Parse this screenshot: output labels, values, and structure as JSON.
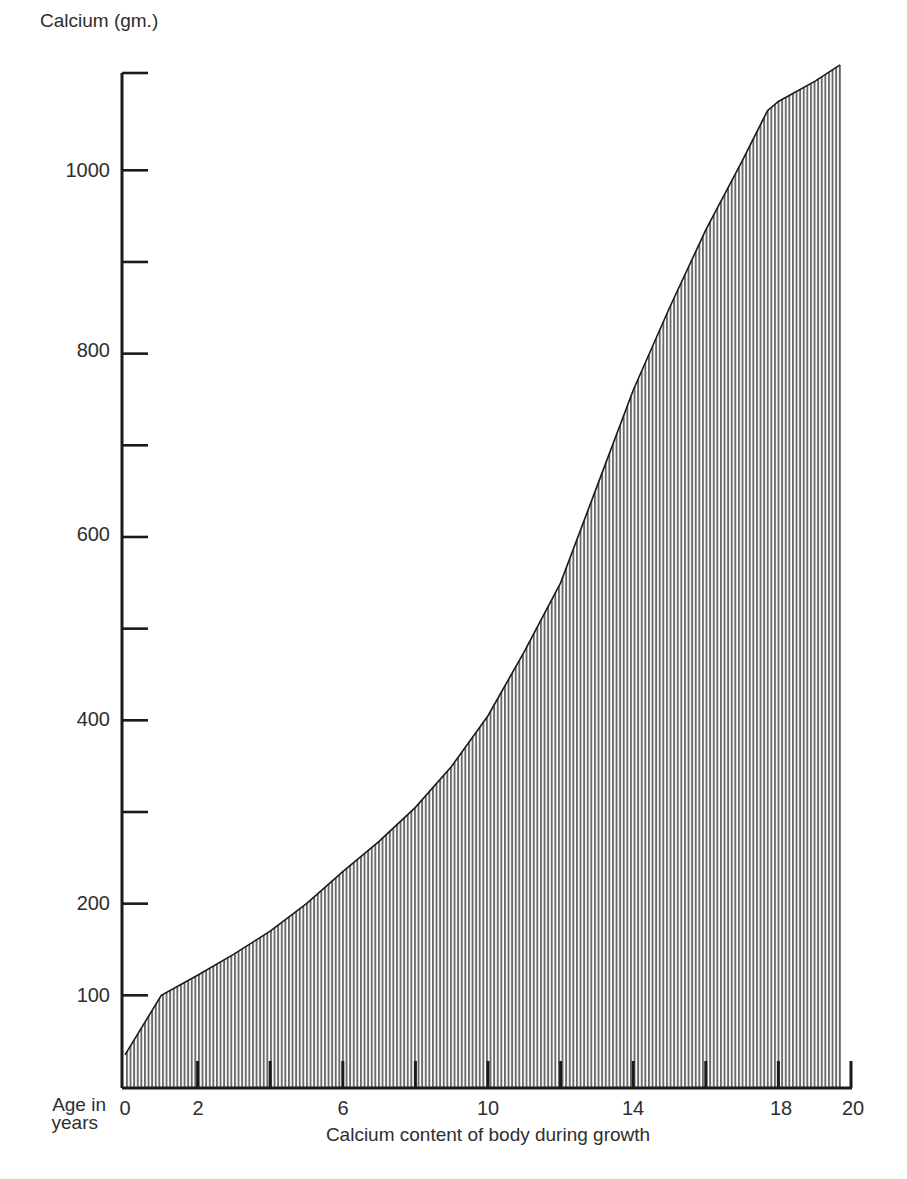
{
  "y_axis": {
    "title": "Calcium (gm.)",
    "tick_labels": [
      "100",
      "200",
      "400",
      "600",
      "800",
      "1000"
    ]
  },
  "x_axis": {
    "title_line1": "Age in",
    "title_line2": "years",
    "tick_labels": [
      "0",
      "2",
      "6",
      "10",
      "14",
      "18",
      "20"
    ]
  },
  "caption": "Calcium content of body during growth",
  "colors": {
    "fill_stripe": "#6a6a6a",
    "line": "#1a1a1a",
    "background": "#ffffff"
  },
  "chart_data": {
    "type": "area",
    "title": "Calcium content of body during growth",
    "xlabel": "Age in years",
    "ylabel": "Calcium (gm.)",
    "x": [
      0,
      1,
      2,
      3,
      4,
      5,
      6,
      7,
      8,
      9,
      10,
      11,
      12,
      13,
      14,
      15,
      16,
      17,
      17.7,
      18,
      19,
      19.7
    ],
    "series": [
      {
        "name": "Calcium content of body",
        "values": [
          35,
          100,
          122,
          145,
          170,
          200,
          235,
          268,
          305,
          350,
          405,
          475,
          550,
          655,
          760,
          850,
          935,
          1010,
          1065,
          1075,
          1097,
          1115
        ]
      }
    ],
    "xlim": [
      0,
      20
    ],
    "ylim": [
      0,
      1100
    ],
    "x_ticks": [
      0,
      2,
      4,
      6,
      8,
      10,
      12,
      14,
      16,
      18,
      20
    ],
    "x_tick_labels": [
      "0",
      "2",
      "6",
      "10",
      "14",
      "18",
      "20"
    ],
    "y_ticks": [
      100,
      200,
      300,
      400,
      500,
      600,
      700,
      800,
      900,
      1000,
      1100
    ],
    "y_tick_labels": [
      "100",
      "200",
      "400",
      "600",
      "800",
      "1000"
    ],
    "fill": "vertical hatching",
    "grid": false,
    "legend": null
  }
}
